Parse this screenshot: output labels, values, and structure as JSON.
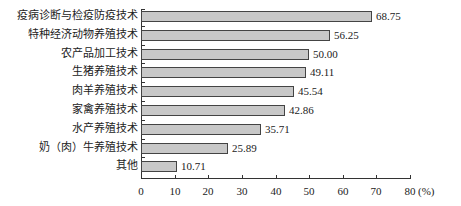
{
  "chart_data": {
    "type": "bar",
    "orientation": "horizontal",
    "title": "",
    "xlabel": "(%)",
    "ylabel": "",
    "xlim": [
      0,
      80
    ],
    "xticks": [
      0,
      10,
      20,
      30,
      40,
      50,
      60,
      70,
      80
    ],
    "grid": false,
    "legend": null,
    "categories": [
      "疫病诊断与检疫防疫技术",
      "特种经济动物养殖技术",
      "农产品加工技术",
      "生猪养殖技术",
      "肉羊养殖技术",
      "家禽养殖技术",
      "水产养殖技术",
      "奶（肉）牛养殖技术",
      "其他"
    ],
    "values": [
      68.75,
      56.25,
      50.0,
      49.11,
      45.54,
      42.86,
      35.71,
      25.89,
      10.71
    ],
    "value_labels": [
      "68.75",
      "56.25",
      "50.00",
      "49.11",
      "45.54",
      "42.86",
      "35.71",
      "25.89",
      "10.71"
    ],
    "bar_color": "#c8c8c8",
    "bar_edge_color": "#444444"
  },
  "axis": {
    "unit_label": "(%)"
  }
}
